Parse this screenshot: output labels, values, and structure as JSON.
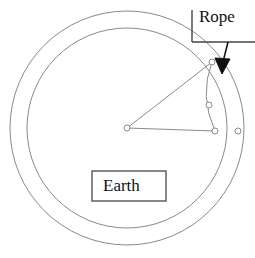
{
  "figure": {
    "title": "",
    "width": 255,
    "height": 258,
    "background": "#ffffff"
  },
  "labels": {
    "rope": "Rope",
    "earth": "Earth"
  },
  "colors": {
    "stroke": "#8a8a8a",
    "dark_stroke": "#444444",
    "box_stroke": "#555555",
    "arrow_fill": "#111111",
    "text": "#111111",
    "node_fill": "#ffffff",
    "background": "#ffffff"
  },
  "geometry": {
    "center": {
      "x": 127,
      "y": 128
    },
    "outer_circle_radius": 117,
    "inner_circle_radius": 100,
    "earth_box": {
      "x": 92,
      "y": 171,
      "width": 74,
      "height": 30
    },
    "rope_label_box": {
      "left_rule_x": 192,
      "left_rule_y1": 10,
      "left_rule_y2": 42,
      "bottom_rule_x1": 192,
      "bottom_rule_x2": 255,
      "bottom_rule_y": 42
    },
    "arrow": {
      "x1": 228,
      "y1": 42,
      "x2": 221,
      "y2": 72
    }
  },
  "nodes": [
    {
      "name": "center-node",
      "x": 127,
      "y": 128
    },
    {
      "name": "rope-top-node",
      "x": 212,
      "y": 62
    },
    {
      "name": "rope-mid-node",
      "x": 209,
      "y": 105
    },
    {
      "name": "rope-bottom-node",
      "x": 215,
      "y": 131
    },
    {
      "name": "outer-circle-node",
      "x": 238,
      "y": 131
    }
  ],
  "edges": [
    {
      "name": "radius-to-rope-top",
      "from": "center-node",
      "to": "rope-top-node"
    },
    {
      "name": "radius-to-rope-bottom",
      "from": "center-node",
      "to": "rope-bottom-node"
    }
  ],
  "rope_curve": {
    "name": "rope-arc",
    "path": "M 212 62 Q 200 96 215 131"
  }
}
